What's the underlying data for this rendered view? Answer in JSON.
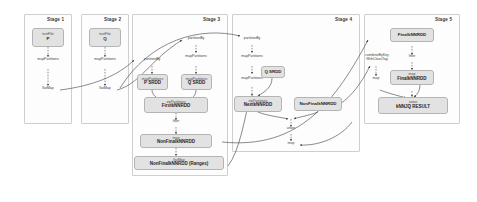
{
  "diagram": {
    "colors": {
      "node_fill": "#e2e2e2",
      "node_border": "#b4b4b4",
      "stage_border": "#cfcfcf",
      "arrow": "#3d3d3d",
      "text": "#1f1f1f"
    }
  },
  "stages": [
    {
      "id": "stage1",
      "label": "Stage 1",
      "nodes": [
        {
          "id": "s1-p",
          "op": "textFile",
          "rdd": "P"
        }
      ],
      "edges": [
        {
          "id": "s1-e1",
          "label": "mapPartitions"
        },
        {
          "id": "s1-e2",
          "label": "flatMap"
        }
      ]
    },
    {
      "id": "stage2",
      "label": "Stage 2",
      "nodes": [
        {
          "id": "s2-q",
          "op": "textFile",
          "rdd": "Q"
        }
      ],
      "edges": [
        {
          "id": "s2-e1",
          "label": "mapPartitions"
        },
        {
          "id": "s2-e2",
          "label": "flatMap"
        }
      ]
    },
    {
      "id": "stage3",
      "label": "Stage 3",
      "nodes": [
        {
          "id": "s3-psrdd",
          "op": "mapPartitions",
          "rdd": "P SRDD"
        },
        {
          "id": "s3-qsrdd",
          "op": "mapPartitions",
          "rdd": "Q SRDD"
        },
        {
          "id": "s3-first",
          "op": "zipPartitions",
          "rdd": "FirstkNNRDD"
        },
        {
          "id": "s3-nonfinal",
          "op": "map",
          "rdd": "NonFinalkNNRDD"
        },
        {
          "id": "s3-ranges",
          "op": "flatMap",
          "rdd": "NonFinalkNNRDD (Ranges)"
        }
      ],
      "edges": [
        {
          "id": "s3-e1",
          "label": "partitionBy"
        },
        {
          "id": "s3-e2",
          "label": "partitionBy"
        },
        {
          "id": "s3-e3",
          "label": "mapPartitions"
        },
        {
          "id": "s3-e4",
          "label": "filter"
        }
      ]
    },
    {
      "id": "stage4",
      "label": "Stage 4",
      "nodes": [
        {
          "id": "s4-qsrdd",
          "op": "",
          "rdd": "Q SRDD"
        },
        {
          "id": "s4-next",
          "op": "zipPartitions",
          "rdd": "NextkNNRDD"
        },
        {
          "id": "s4-nonfinal",
          "op": "",
          "rdd": "NonFinalkNNRDD"
        }
      ],
      "edges": [
        {
          "id": "s4-e1",
          "label": "partitionBy"
        },
        {
          "id": "s4-e2",
          "label": "mapPartitions"
        },
        {
          "id": "s4-e3",
          "label": "mapPartitions"
        },
        {
          "id": "s4-e4",
          "label": "union"
        },
        {
          "id": "s4-e5",
          "label": "map"
        }
      ]
    },
    {
      "id": "stage5",
      "label": "Stage 5",
      "nodes": [
        {
          "id": "s5-final-top",
          "op": "",
          "rdd": "FinalkNNRDD"
        },
        {
          "id": "s5-final-map",
          "op": "map",
          "rdd": "FinalkNNRDD"
        },
        {
          "id": "s5-result",
          "op": "union",
          "rdd": "kNNJQ RESULT"
        }
      ],
      "edges": [
        {
          "id": "s5-e1",
          "label": "filter"
        },
        {
          "id": "s5-e2",
          "label": "combineByKey\nWithClassTag"
        },
        {
          "id": "s5-e3",
          "label": "map"
        }
      ]
    }
  ],
  "labels": {
    "stage1_title": "Stage 1",
    "stage2_title": "Stage 2",
    "stage3_title": "Stage 3",
    "stage4_title": "Stage 4",
    "stage5_title": "Stage 5",
    "textfile": "textFile",
    "p": "P",
    "q": "Q",
    "mapPartitions": "mapPartitions",
    "flatMap": "flatMap",
    "partitionBy": "partitionBy",
    "filter": "filter",
    "map": "map",
    "union": "union",
    "combineByKey": "combineByKey",
    "withClassTag": "WithClassTag",
    "zipPartitions": "zipPartitions",
    "p_srdd": "P SRDD",
    "q_srdd": "Q SRDD",
    "first_knn": "FirstkNNRDD",
    "nonfinal_knn": "NonFinalkNNRDD",
    "nonfinal_ranges": "NonFinalkNNRDD (Ranges)",
    "next_knn": "NextkNNRDD",
    "final_knn": "FinalkNNRDD",
    "result": "kNNJQ RESULT"
  }
}
